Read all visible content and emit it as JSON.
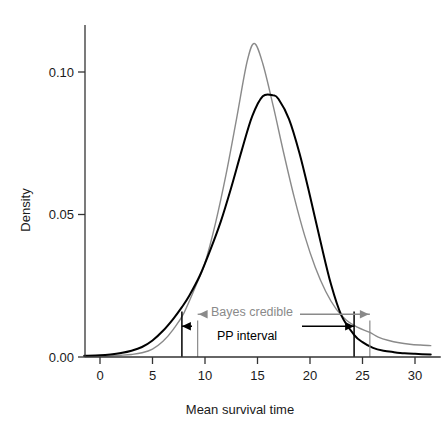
{
  "chart_data": {
    "type": "line",
    "title": "",
    "xlabel": "Mean survival time",
    "ylabel": "Density",
    "xlim": [
      -1.5,
      31.5
    ],
    "ylim": [
      0.0,
      0.115
    ],
    "xticks": [
      0,
      5,
      10,
      15,
      20,
      25,
      30
    ],
    "xtick_labels": [
      "0",
      "5",
      "10",
      "15",
      "20",
      "25",
      "30"
    ],
    "yticks": [
      0.0,
      0.05,
      0.1
    ],
    "ytick_labels": [
      "0.00",
      "0.05",
      "0.10"
    ],
    "grid": false,
    "legend": "none",
    "series": [
      {
        "name": "Posterior predictive density",
        "color": "#000000",
        "linewidth": 2.0,
        "x": [
          -1.5,
          0,
          1,
          2,
          3,
          4,
          5,
          6,
          7,
          7.8,
          8.5,
          9.5,
          10.5,
          11.5,
          12.5,
          13.5,
          14.5,
          15.5,
          16.5,
          17,
          18,
          19,
          20,
          21,
          22,
          23,
          24.2,
          25,
          26,
          27,
          28,
          29,
          30,
          31.5
        ],
        "y": [
          0.0004,
          0.0006,
          0.0009,
          0.0014,
          0.0022,
          0.0035,
          0.0058,
          0.0092,
          0.0135,
          0.0175,
          0.0215,
          0.0285,
          0.0375,
          0.0475,
          0.0595,
          0.0725,
          0.0845,
          0.0915,
          0.0918,
          0.0905,
          0.0835,
          0.0715,
          0.0565,
          0.0405,
          0.0255,
          0.0145,
          0.0078,
          0.0052,
          0.0032,
          0.0022,
          0.0017,
          0.0013,
          0.0011,
          0.0009
        ]
      },
      {
        "name": "Bayes credible density",
        "color": "#8a8a8a",
        "linewidth": 1.4,
        "x": [
          -1.5,
          0,
          1,
          2,
          3,
          4,
          5,
          6,
          7,
          8,
          9.3,
          10,
          11,
          12,
          13,
          14,
          14.7,
          15.5,
          16.5,
          17.5,
          18.5,
          19.5,
          20.5,
          21.5,
          22.5,
          23.5,
          24.5,
          25.7,
          26.5,
          27.5,
          28.5,
          29.5,
          30.5,
          31.5
        ],
        "y": [
          0.0002,
          0.0003,
          0.0004,
          0.0006,
          0.0009,
          0.0015,
          0.0028,
          0.0055,
          0.0098,
          0.0155,
          0.0265,
          0.033,
          0.047,
          0.064,
          0.0835,
          0.1035,
          0.11,
          0.103,
          0.088,
          0.0715,
          0.056,
          0.0425,
          0.0315,
          0.023,
          0.0168,
          0.0128,
          0.0105,
          0.0086,
          0.007,
          0.0058,
          0.005,
          0.0045,
          0.0042,
          0.004
        ]
      }
    ],
    "intervals": [
      {
        "name": "PP interval",
        "label": "PP interval",
        "color": "#000000",
        "lower": 7.8,
        "upper": 24.2,
        "marker_top": 0.016,
        "arrow_y": 0.0108
      },
      {
        "name": "Bayes credible",
        "label": "Bayes credible",
        "color": "#8a8a8a",
        "lower": 9.3,
        "upper": 25.7,
        "marker_top": 0.0128,
        "arrow_y": 0.015
      }
    ]
  },
  "axes": {
    "x_label": "Mean survival time",
    "y_label": "Density"
  }
}
